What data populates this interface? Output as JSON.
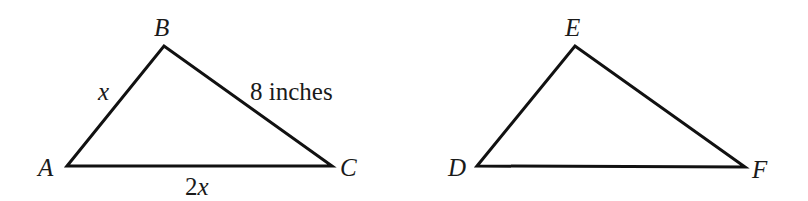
{
  "diagram": {
    "type": "geometry-triangles",
    "stroke_color": "#111111",
    "background": "#ffffff",
    "triangles": [
      {
        "name": "ABC",
        "vertices": {
          "A": {
            "label": "A",
            "x": 67,
            "y": 166
          },
          "B": {
            "label": "B",
            "x": 164,
            "y": 46
          },
          "C": {
            "label": "C",
            "x": 332,
            "y": 166
          }
        },
        "sides": {
          "AB": "x",
          "BC": "8 inches",
          "AC_prefix": "2",
          "AC_var": "x"
        }
      },
      {
        "name": "DEF",
        "vertices": {
          "D": {
            "label": "D",
            "x": 477,
            "y": 166
          },
          "E": {
            "label": "E",
            "x": 575,
            "y": 46
          },
          "F": {
            "label": "F",
            "x": 745,
            "y": 167
          }
        },
        "sides": {}
      }
    ]
  }
}
